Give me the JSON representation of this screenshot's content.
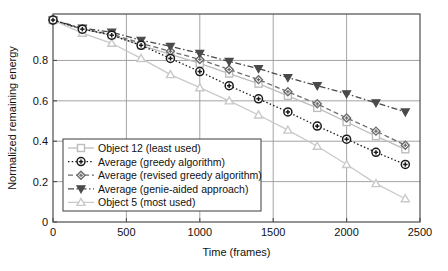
{
  "chart_data": {
    "type": "line",
    "title": "",
    "xlabel": "Time (frames)",
    "ylabel": "Normalized remaining energy",
    "xlim": [
      0,
      2500
    ],
    "ylim": [
      0,
      1.03
    ],
    "xticks": [
      0,
      500,
      1000,
      1500,
      2000,
      2500
    ],
    "xticklabels": [
      "0",
      "500",
      "1000",
      "1500",
      "2000",
      "2500"
    ],
    "yticks": [
      0,
      0.2,
      0.4,
      0.6,
      0.8
    ],
    "yticklabels": [
      "0",
      "0.2",
      "0.4",
      "0.6",
      "0.8"
    ],
    "grid": true,
    "legend_position": "lower left",
    "x": [
      0,
      200,
      400,
      600,
      800,
      1000,
      1200,
      1400,
      1600,
      1800,
      2000,
      2200,
      2400
    ],
    "series": [
      {
        "name": "Object 12 (least used)",
        "marker": "square",
        "linestyle": "solid",
        "color": "#bdbdbd",
        "values": [
          1.0,
          0.955,
          0.925,
          0.875,
          0.83,
          0.785,
          0.735,
          0.685,
          0.625,
          0.565,
          0.495,
          0.425,
          0.36
        ]
      },
      {
        "name": "Average (greedy algorithm)",
        "marker": "circle-dot",
        "linestyle": "dotted",
        "color": "#1a1a1a",
        "values": [
          1.0,
          0.955,
          0.925,
          0.875,
          0.81,
          0.745,
          0.675,
          0.61,
          0.545,
          0.475,
          0.41,
          0.345,
          0.285
        ]
      },
      {
        "name": "Average (revised greedy algorithm)",
        "marker": "diamond",
        "linestyle": "dashed",
        "color": "#6b6b6b",
        "values": [
          1.0,
          0.955,
          0.93,
          0.885,
          0.845,
          0.805,
          0.755,
          0.705,
          0.645,
          0.585,
          0.515,
          0.45,
          0.38
        ]
      },
      {
        "name": "Average (genie-aided approach)",
        "marker": "triangle-down",
        "linestyle": "dashdot",
        "color": "#4a4a4a",
        "values": [
          1.0,
          0.96,
          0.94,
          0.9,
          0.87,
          0.835,
          0.795,
          0.76,
          0.715,
          0.675,
          0.635,
          0.59,
          0.545
        ]
      },
      {
        "name": "Object 5 (most used)",
        "marker": "triangle-up",
        "linestyle": "solid",
        "color": "#c9c9c9",
        "values": [
          1.0,
          0.935,
          0.885,
          0.81,
          0.73,
          0.665,
          0.6,
          0.53,
          0.455,
          0.375,
          0.285,
          0.19,
          0.115
        ]
      }
    ],
    "colors": {
      "axis": "#4d4d4d",
      "grid": "#9a9a9a",
      "background": "#ffffff"
    }
  }
}
